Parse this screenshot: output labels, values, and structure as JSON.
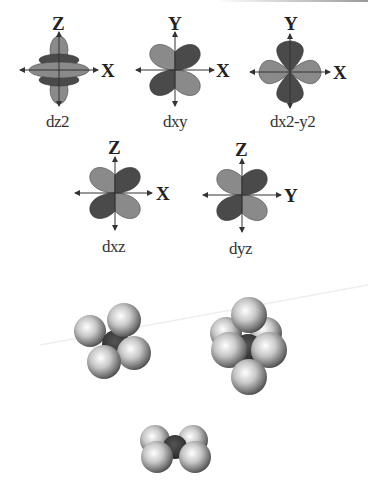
{
  "figure": {
    "orbitals_row1": [
      {
        "name": "dz2",
        "vertical_axis": "Z",
        "horizontal_axis": "X"
      },
      {
        "name": "dxy",
        "vertical_axis": "Y",
        "horizontal_axis": "X"
      },
      {
        "name": "dx2-y2",
        "vertical_axis": "Y",
        "horizontal_axis": "X"
      }
    ],
    "orbitals_row2": [
      {
        "name": "dxz",
        "vertical_axis": "Z",
        "horizontal_axis": "X"
      },
      {
        "name": "dyz",
        "vertical_axis": "Z",
        "horizontal_axis": "Y"
      }
    ],
    "molecules": [
      {
        "geometry": "tetrahedral",
        "ligand_count": 4
      },
      {
        "geometry": "octahedral",
        "ligand_count": 6
      },
      {
        "geometry": "square-planar",
        "ligand_count": 4
      }
    ],
    "colors": {
      "lobe_light": "#8a8a8a",
      "lobe_dark": "#4a4a4a",
      "axis": "#333333",
      "ligand_sphere": "#d8d8d8",
      "metal_center": "#3a3a3a"
    }
  }
}
